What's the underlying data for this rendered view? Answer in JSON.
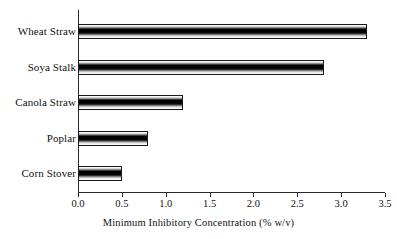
{
  "chart_data": {
    "type": "bar",
    "orientation": "horizontal",
    "title": "",
    "subtitle": "",
    "xlabel": "Minimum Inhibitory Concentration (% w/v)",
    "ylabel": "",
    "categories": [
      "Corn Stover",
      "Poplar",
      "Canola Straw",
      "Soya Stalk",
      "Wheat Straw"
    ],
    "values": [
      0.5,
      0.8,
      1.2,
      2.8,
      3.3
    ],
    "series": [
      {
        "name": "Minimum Inhibitory Concentration",
        "values": [
          0.5,
          0.8,
          1.2,
          2.8,
          3.3
        ]
      }
    ],
    "xlim": [
      0.0,
      3.5
    ],
    "xticks": [
      0.0,
      0.5,
      1.0,
      1.5,
      2.0,
      2.5,
      3.0,
      3.5
    ],
    "xtick_labels": [
      "0.0",
      "0.5",
      "1.0",
      "1.5",
      "2.0",
      "2.5",
      "3.0",
      "3.5"
    ],
    "grid": false,
    "legend": false,
    "legend_position": "none",
    "bar_fill": "vertical-gradient-white-black-white",
    "bar_edge_color": "#1a1a1a",
    "axis_color": "#2b2b2b",
    "background_color": "#ffffff",
    "annotations": []
  },
  "bars": [
    {
      "label": "Wheat Straw",
      "value": 3.3
    },
    {
      "label": "Soya Stalk",
      "value": 2.8
    },
    {
      "label": "Canola Straw",
      "value": 1.2
    },
    {
      "label": "Poplar",
      "value": 0.8
    },
    {
      "label": "Corn Stover",
      "value": 0.5
    }
  ],
  "xticks": [
    {
      "label": "0.0",
      "value": 0.0
    },
    {
      "label": "0.5",
      "value": 0.5
    },
    {
      "label": "1.0",
      "value": 1.0
    },
    {
      "label": "1.5",
      "value": 1.5
    },
    {
      "label": "2.0",
      "value": 2.0
    },
    {
      "label": "2.5",
      "value": 2.5
    },
    {
      "label": "3.0",
      "value": 3.0
    },
    {
      "label": "3.5",
      "value": 3.5
    }
  ],
  "axis": {
    "x_title": "Minimum Inhibitory Concentration (% w/v)"
  }
}
